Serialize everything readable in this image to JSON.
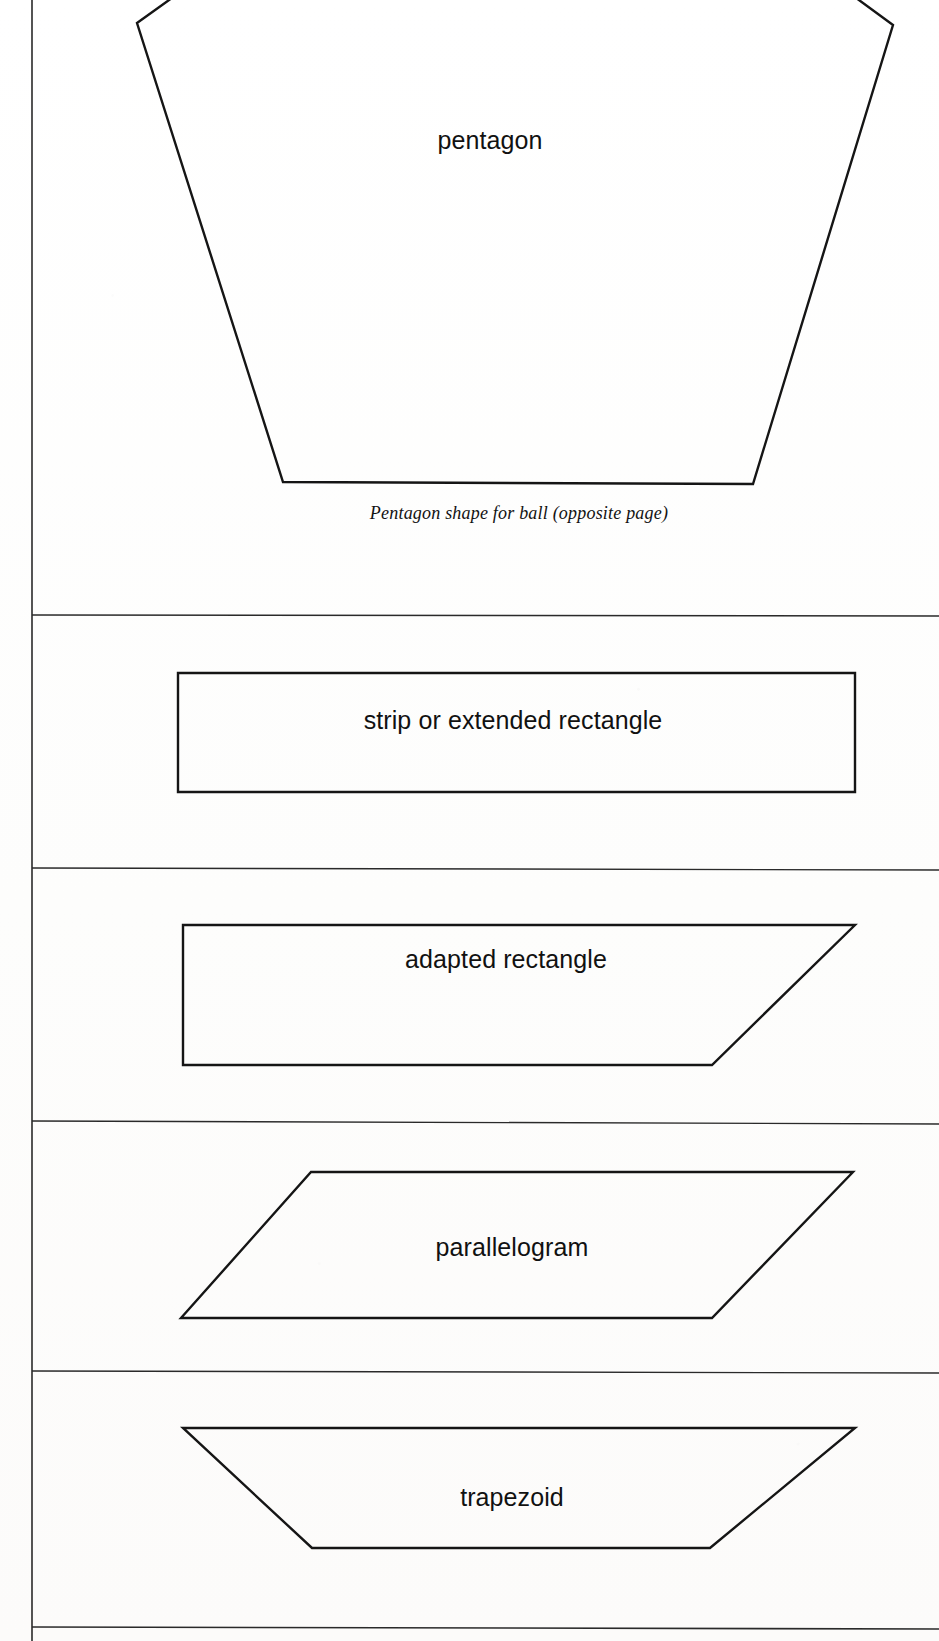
{
  "page": {
    "width": 939,
    "height": 1641,
    "background_color": "#fefefe",
    "ink_color": "#151515"
  },
  "frame": {
    "left_rule_x": 32,
    "left_rule_top": 0,
    "left_rule_bottom": 1641,
    "bottom_rule_y": 1627,
    "bottom_rule_x1": 32,
    "bottom_rule_x2": 939,
    "dividers_y": [
      615,
      868,
      1122,
      1371
    ],
    "divider_x1": 32,
    "divider_x2": 939
  },
  "sections": [
    {
      "id": "pentagon-section",
      "shape_name": "pentagon",
      "label": "pentagon",
      "label_x": 490,
      "label_y": 140,
      "label_size": 25,
      "caption": "Pentagon shape for ball (opposite page)",
      "caption_x": 519,
      "caption_y": 513,
      "caption_size": 18,
      "polygon_points": "518,-250 137,23 283,482 753,484 893,25",
      "stroke_width": 2.4
    },
    {
      "id": "strip-section",
      "shape_name": "strip-or-extended-rectangle",
      "label": "strip or extended rectangle",
      "label_x": 513,
      "label_y": 720,
      "label_size": 25,
      "polygon_points": "178,673 855,673 855,792 178,792",
      "stroke_width": 2.4
    },
    {
      "id": "adapted-rectangle-section",
      "shape_name": "adapted-rectangle",
      "label": "adapted rectangle",
      "label_x": 506,
      "label_y": 959,
      "label_size": 25,
      "polygon_points": "183,925 855,925 712,1065 183,1065",
      "stroke_width": 2.4
    },
    {
      "id": "parallelogram-section",
      "shape_name": "parallelogram",
      "label": "parallelogram",
      "label_x": 512,
      "label_y": 1247,
      "label_size": 25,
      "polygon_points": "311,1172 853,1172 712,1318 181,1318",
      "stroke_width": 2.4
    },
    {
      "id": "trapezoid-section",
      "shape_name": "trapezoid",
      "label": "trapezoid",
      "label_x": 512,
      "label_y": 1497,
      "label_size": 25,
      "polygon_points": "183,1428 855,1428 710,1548 312,1548",
      "stroke_width": 2.4
    }
  ]
}
